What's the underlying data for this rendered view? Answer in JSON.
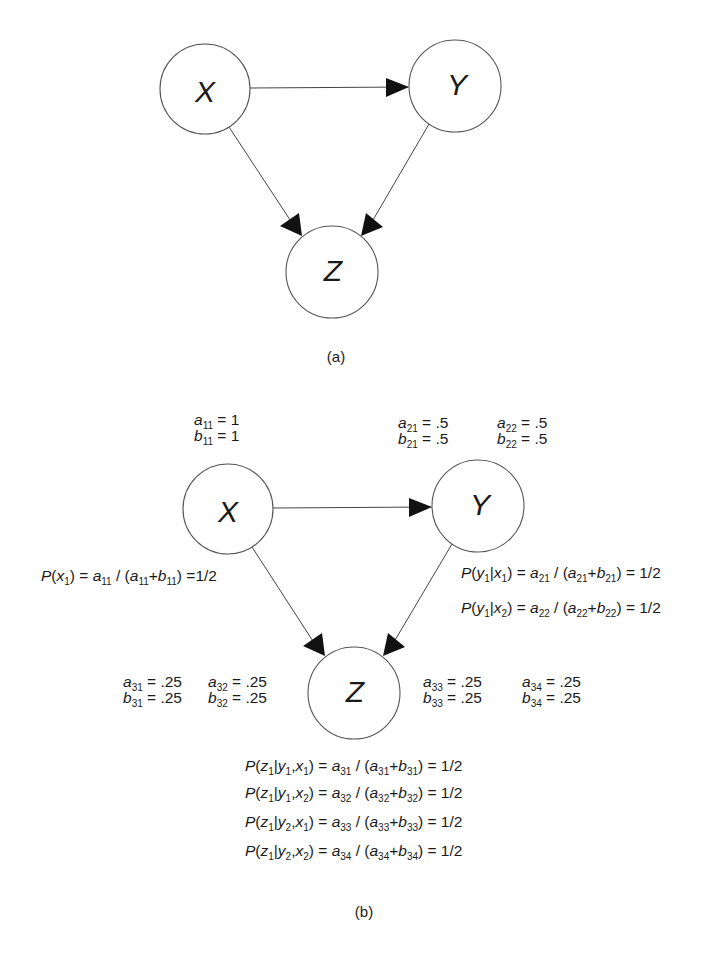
{
  "figure": {
    "panel_a": {
      "caption": "(a)",
      "nodes": [
        {
          "id": "X",
          "label": "X",
          "cx": 205,
          "cy": 89,
          "r": 45
        },
        {
          "id": "Y",
          "label": "Y",
          "cx": 455,
          "cy": 86,
          "r": 46
        },
        {
          "id": "Z",
          "label": "Z",
          "cx": 332,
          "cy": 272,
          "r": 46
        }
      ],
      "edges": [
        {
          "from": "X",
          "to": "Y"
        },
        {
          "from": "X",
          "to": "Z"
        },
        {
          "from": "Y",
          "to": "Z"
        }
      ]
    },
    "panel_b": {
      "caption": "(b)",
      "nodes": [
        {
          "id": "X",
          "label": "X",
          "cx": 228,
          "cy": 509,
          "r": 45
        },
        {
          "id": "Y",
          "label": "Y",
          "cx": 478,
          "cy": 506,
          "r": 46
        },
        {
          "id": "Z",
          "label": "Z",
          "cx": 354,
          "cy": 693,
          "r": 46
        }
      ],
      "edges": [
        {
          "from": "X",
          "to": "Y"
        },
        {
          "from": "X",
          "to": "Z"
        },
        {
          "from": "Y",
          "to": "Z"
        }
      ],
      "params": {
        "a11": "1",
        "b11": "1",
        "a21": ".5",
        "b21": ".5",
        "a22": ".5",
        "b22": ".5",
        "a31": ".25",
        "b31": ".25",
        "a32": ".25",
        "b32": ".25",
        "a33": ".25",
        "b33": ".25",
        "a34": ".25",
        "b34": ".25"
      },
      "equations": {
        "px1": "=1/2",
        "py1x1": "= 1/2",
        "py1x2": "= 1/2",
        "pz1y1x1": "= 1/2",
        "pz1y1x2": "= 1/2",
        "pz1y2x1": "= 1/2",
        "pz1y2x2": "= 1/2"
      }
    }
  }
}
